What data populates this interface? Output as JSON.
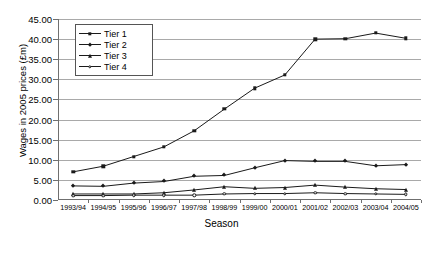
{
  "axes": {
    "ylabel": "Wages in 2005 prices (£m)",
    "xlabel": "Season",
    "yticks": [
      "0.00",
      "5.00",
      "10.00",
      "15.00",
      "20.00",
      "25.00",
      "30.00",
      "35.00",
      "40.00",
      "45.00"
    ]
  },
  "legend": {
    "items": [
      {
        "label": "Tier 1",
        "marker": "square"
      },
      {
        "label": "Tier 2",
        "marker": "diamond"
      },
      {
        "label": "Tier 3",
        "marker": "triangle"
      },
      {
        "label": "Tier 4",
        "marker": "circle"
      }
    ]
  },
  "topnoise": "",
  "caption": "",
  "chart_data": {
    "type": "line",
    "title": "",
    "xlabel": "Season",
    "ylabel": "Wages in 2005 prices (£m)",
    "ylim": [
      0,
      45
    ],
    "ytick_step": 5,
    "grid": true,
    "legend_position": "top-left-inside",
    "categories": [
      "1993/94",
      "1994/95",
      "1995/96",
      "1996/97",
      "1997/98",
      "1998/99",
      "1999/00",
      "2000/01",
      "2001/02",
      "2002/03",
      "2003/04",
      "2004/05"
    ],
    "series": [
      {
        "name": "Tier 1",
        "marker": "square",
        "values": [
          7.0,
          8.4,
          10.8,
          13.2,
          17.2,
          22.6,
          27.8,
          31.1,
          40.0,
          40.1,
          41.5,
          40.2
        ]
      },
      {
        "name": "Tier 2",
        "marker": "diamond",
        "values": [
          3.5,
          3.4,
          4.2,
          4.6,
          5.9,
          6.1,
          8.0,
          9.8,
          9.6,
          9.6,
          8.5,
          8.8
        ]
      },
      {
        "name": "Tier 3",
        "marker": "triangle",
        "values": [
          1.5,
          1.5,
          1.5,
          1.8,
          2.5,
          3.3,
          2.9,
          3.1,
          3.7,
          3.2,
          2.8,
          2.6
        ]
      },
      {
        "name": "Tier 4",
        "marker": "circle",
        "values": [
          1.1,
          1.1,
          1.2,
          1.2,
          1.2,
          1.5,
          1.6,
          1.6,
          1.8,
          1.6,
          1.5,
          1.4
        ]
      }
    ]
  }
}
